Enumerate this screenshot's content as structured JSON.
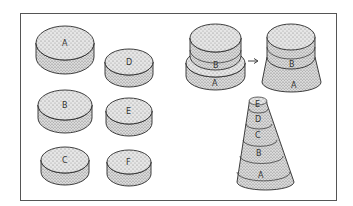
{
  "colors": {
    "background": "#ffffff",
    "frame": "#555555",
    "outline": "#2a2a2a",
    "stipple_fill": "#e6e6e6",
    "stipple_dot": "#7a7a7a"
  },
  "figure": {
    "left_panel": {
      "discs": [
        {
          "label": "A",
          "cx": 65,
          "cy": 43,
          "rx": 29,
          "ry": 17,
          "depth": 14
        },
        {
          "label": "B",
          "cx": 65,
          "cy": 105,
          "rx": 27,
          "ry": 15,
          "depth": 13
        },
        {
          "label": "C",
          "cx": 65,
          "cy": 160,
          "rx": 24,
          "ry": 13,
          "depth": 12
        },
        {
          "label": "D",
          "cx": 129,
          "cy": 62,
          "rx": 24,
          "ry": 13,
          "depth": 12
        },
        {
          "label": "E",
          "cx": 129,
          "cy": 111,
          "rx": 23,
          "ry": 13,
          "depth": 12
        },
        {
          "label": "F",
          "cx": 129,
          "cy": 162,
          "rx": 22,
          "ry": 12,
          "depth": 12
        }
      ]
    },
    "stack_before": {
      "labels": {
        "top": "B",
        "bottom": "A"
      }
    },
    "arrow": {
      "symbol": "→"
    },
    "stack_after": {
      "labels": {
        "top": "B",
        "bottom": "A"
      }
    },
    "cone": {
      "bands": [
        "E",
        "D",
        "C",
        "B",
        "A"
      ]
    }
  }
}
